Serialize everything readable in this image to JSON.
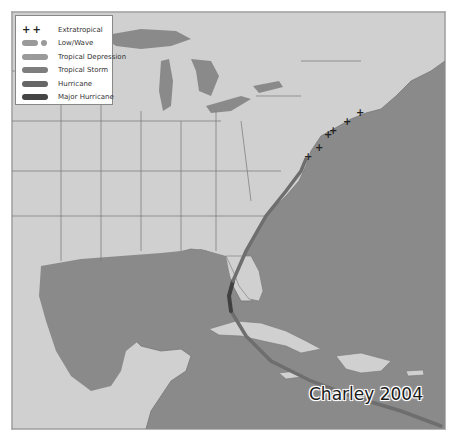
{
  "map": {
    "title": "Charley 2004",
    "colors": {
      "ocean": "#8a8a8a",
      "land": "#d0d0d0",
      "borders": "#777777",
      "track_tropical_storm": "#6e6e6e",
      "track_hurricane": "#5e5e5e",
      "track_major_hurricane": "#404040",
      "extratropical_marker": "#222222"
    }
  },
  "legend": {
    "items": [
      {
        "symbol": "plus-markers",
        "label": "Extratropical"
      },
      {
        "symbol": "dashed-line",
        "label": "Low/Wave"
      },
      {
        "symbol": "line",
        "label": "Tropical Depression",
        "color": "#9a9a9a"
      },
      {
        "symbol": "line",
        "label": "Tropical Storm",
        "color": "#7e7e7e"
      },
      {
        "symbol": "line",
        "label": "Hurricane",
        "color": "#666666"
      },
      {
        "symbol": "line",
        "label": "Major Hurricane",
        "color": "#454545"
      }
    ]
  }
}
